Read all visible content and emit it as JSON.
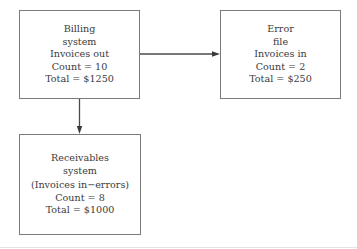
{
  "diagram": {
    "nodes": [
      {
        "id": "billing",
        "lines": [
          "Billing",
          "system",
          "Invoices out",
          "Count = 10",
          "Total = $1250"
        ]
      },
      {
        "id": "error",
        "lines": [
          "Error",
          "file",
          "Invoices in",
          "Count = 2",
          "Total = $250"
        ]
      },
      {
        "id": "receivables",
        "lines": [
          "Receivables",
          "system",
          "(Invoices in−errors)",
          "Count = 8",
          "Total = $1000"
        ]
      }
    ],
    "edges": [
      {
        "from": "billing",
        "to": "error",
        "direction": "right"
      },
      {
        "from": "billing",
        "to": "receivables",
        "direction": "down"
      }
    ],
    "colors": {
      "border": "#7a7a7a",
      "arrow": "#4a4a4a",
      "text": "#3a3a3a",
      "background": "#ffffff"
    }
  }
}
